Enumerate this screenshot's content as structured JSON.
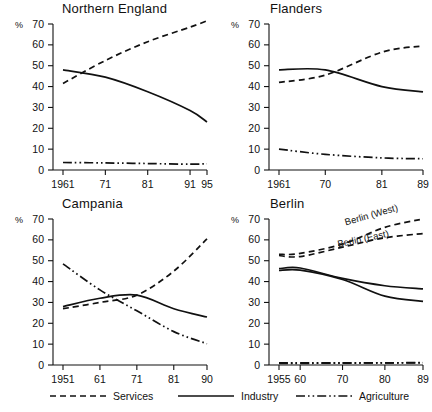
{
  "figure": {
    "width": 432,
    "height": 412,
    "yaxis": {
      "unit_label": "%",
      "ticks": [
        0,
        10,
        20,
        30,
        40,
        50,
        60,
        70
      ],
      "min": 0,
      "max": 70
    }
  },
  "legend": {
    "items": [
      {
        "key": "services",
        "label": "Services",
        "style": "dashed"
      },
      {
        "key": "industry",
        "label": "Industry",
        "style": "solid"
      },
      {
        "key": "agriculture",
        "label": "Agriculture",
        "style": "dash-dot-dot"
      }
    ]
  },
  "chart_data": [
    {
      "type": "line",
      "title": "Northern England",
      "xlabel": "",
      "ylabel": "%",
      "ylim": [
        0,
        70
      ],
      "grid": false,
      "legend_position": "bottom",
      "x": [
        1961,
        1971,
        1981,
        1991,
        1995
      ],
      "tick_labels": [
        "1961",
        "71",
        "81",
        "91",
        "95"
      ],
      "series": [
        {
          "name": "Services",
          "style": "dashed",
          "values": [
            41.5,
            52.5,
            61.5,
            68.5,
            71.5
          ]
        },
        {
          "name": "Industry",
          "style": "solid",
          "values": [
            48.0,
            44.5,
            37.5,
            28.5,
            23.0
          ]
        },
        {
          "name": "Agriculture",
          "style": "dash-dot-dot",
          "values": [
            3.6,
            3.4,
            3.1,
            2.8,
            3.0
          ]
        }
      ]
    },
    {
      "type": "line",
      "title": "Flanders",
      "xlabel": "",
      "ylabel": "%",
      "ylim": [
        0,
        70
      ],
      "grid": false,
      "legend_position": "bottom",
      "x": [
        1961,
        1970,
        1981,
        1989
      ],
      "tick_labels": [
        "1961",
        "70",
        "81",
        "89"
      ],
      "series": [
        {
          "name": "Services",
          "style": "dashed",
          "values": [
            42.0,
            45.5,
            56.5,
            59.5
          ]
        },
        {
          "name": "Industry",
          "style": "solid",
          "values": [
            48.0,
            48.0,
            40.0,
            37.5
          ]
        },
        {
          "name": "Agriculture",
          "style": "dash-dot-dot",
          "values": [
            10.0,
            7.5,
            5.8,
            5.4
          ]
        }
      ]
    },
    {
      "type": "line",
      "title": "Campania",
      "xlabel": "",
      "ylabel": "%",
      "ylim": [
        0,
        70
      ],
      "grid": false,
      "legend_position": "bottom",
      "x": [
        1951,
        1961,
        1971,
        1981,
        1990
      ],
      "tick_labels": [
        "1951",
        "61",
        "71",
        "81",
        "90"
      ],
      "series": [
        {
          "name": "Services",
          "style": "dashed",
          "values": [
            27.0,
            30.0,
            33.5,
            45.0,
            60.5
          ]
        },
        {
          "name": "Industry",
          "style": "solid",
          "values": [
            28.0,
            32.0,
            33.5,
            27.0,
            23.0
          ]
        },
        {
          "name": "Agriculture",
          "style": "dash-dot-dot",
          "values": [
            48.5,
            36.0,
            26.0,
            16.0,
            10.2
          ]
        }
      ]
    },
    {
      "type": "line",
      "title": "Berlin",
      "xlabel": "",
      "ylabel": "%",
      "ylim": [
        0,
        70
      ],
      "grid": false,
      "legend_position": "bottom",
      "x": [
        1955,
        1960,
        1970,
        1980,
        1989
      ],
      "tick_labels": [
        "1955",
        "60",
        "70",
        "80",
        "89"
      ],
      "annotations": [
        {
          "text": "Berlin (West)",
          "x": 1977,
          "y": 70.5,
          "rotation": -16
        },
        {
          "text": "Berlin (East)",
          "x": 1975,
          "y": 59.0,
          "rotation": -12
        }
      ],
      "series": [
        {
          "name": "Services (West)",
          "style": "dashed",
          "values": [
            53.0,
            53.5,
            58.0,
            66.0,
            70.0
          ]
        },
        {
          "name": "Services (East)",
          "style": "dashed",
          "values": [
            52.5,
            52.0,
            56.5,
            61.0,
            63.0
          ]
        },
        {
          "name": "Industry (West)",
          "style": "solid",
          "values": [
            46.2,
            46.5,
            41.5,
            38.0,
            36.5
          ]
        },
        {
          "name": "Industry (East)",
          "style": "solid",
          "values": [
            45.3,
            45.5,
            41.0,
            33.0,
            30.5
          ]
        },
        {
          "name": "Agriculture (West)",
          "style": "dash-dot-dot",
          "values": [
            1.0,
            1.0,
            1.0,
            1.0,
            1.2
          ]
        },
        {
          "name": "Agriculture (East)",
          "style": "dash-dot-dot",
          "values": [
            0.8,
            0.8,
            0.9,
            1.0,
            1.0
          ]
        }
      ]
    }
  ]
}
